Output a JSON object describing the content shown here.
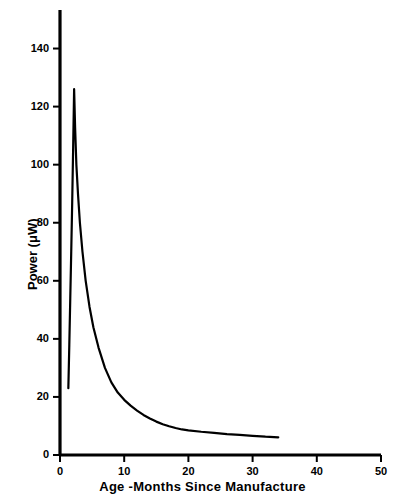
{
  "chart_data": {
    "type": "line",
    "title": "",
    "xlabel": "Age -Months Since Manufacture",
    "ylabel": "Power (μW)",
    "xlim": [
      0,
      50
    ],
    "ylim": [
      0,
      150
    ],
    "xticks": [
      0,
      10,
      20,
      30,
      40,
      50
    ],
    "yticks": [
      0,
      20,
      40,
      60,
      80,
      100,
      120,
      140
    ],
    "xtick_labels": [
      "0",
      "10",
      "20",
      "30",
      "40",
      "50"
    ],
    "ytick_labels": [
      "0",
      "20",
      "40",
      "60",
      "80",
      "100",
      "120",
      "140"
    ],
    "grid": false,
    "legend": null,
    "line_color": "#000000",
    "line_width": 2.2,
    "series": [
      {
        "name": "Power vs Age",
        "x": [
          1.3,
          1.45,
          1.6,
          1.75,
          1.9,
          2.05,
          2.2,
          2.35,
          2.55,
          2.8,
          3.1,
          3.5,
          4.0,
          4.6,
          5.2,
          6.0,
          7.0,
          8.0,
          9.0,
          10.0,
          11.0,
          12.0,
          13.0,
          14.0,
          15.0,
          16.0,
          17.0,
          18.0,
          19.0,
          20.0,
          22.0,
          24.0,
          26.0,
          28.0,
          30.0,
          32.0,
          34.0
        ],
        "y": [
          23.0,
          38.0,
          54.0,
          70.0,
          87.0,
          106.0,
          126.0,
          113.0,
          100.0,
          90.0,
          80.0,
          70.0,
          60.0,
          51.0,
          44.0,
          37.0,
          30.0,
          25.0,
          21.5,
          19.0,
          17.0,
          15.3,
          13.8,
          12.6,
          11.5,
          10.6,
          9.9,
          9.3,
          8.8,
          8.5,
          8.0,
          7.6,
          7.2,
          6.9,
          6.6,
          6.3,
          6.1
        ]
      }
    ],
    "annotations": {
      "peak_value": 126,
      "peak_age": 2.2,
      "start_value": 23,
      "end_value": 6.1,
      "end_age": 34
    }
  }
}
